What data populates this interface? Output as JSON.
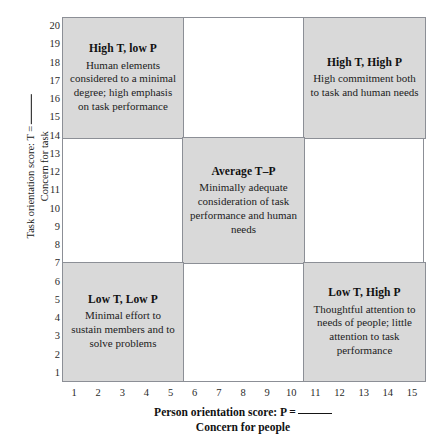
{
  "chart_data": {
    "type": "table",
    "xlabel_line1": "Person orientation score: P =",
    "xlabel_line2": "Concern for people",
    "ylabel_line1": "Task orientation score: T =",
    "ylabel_line2": "Concern for task",
    "xlim": [
      1,
      15
    ],
    "ylim": [
      1,
      20
    ],
    "x_ticks": [
      1,
      2,
      3,
      4,
      5,
      6,
      7,
      8,
      9,
      10,
      11,
      12,
      13,
      14,
      15
    ],
    "y_ticks": [
      1,
      2,
      3,
      4,
      5,
      6,
      7,
      8,
      9,
      10,
      11,
      12,
      13,
      14,
      15,
      16,
      17,
      18,
      19,
      20
    ],
    "grid": true,
    "legend": "none",
    "column_dividers_x": [
      5.5,
      10.5
    ],
    "row_dividers_y": [
      7.5,
      13.5
    ],
    "shaded_color": "#d9d9d9",
    "border_color": "#8c8f96",
    "cells": [
      {
        "id": "high-t-low-p",
        "row": "top",
        "column": "left",
        "shaded": true,
        "title": "High T, low P",
        "body": "Human elements considered to a minimal degree; high emphasis on task performance"
      },
      {
        "id": "top-middle-empty",
        "row": "top",
        "column": "middle",
        "shaded": false,
        "title": "",
        "body": ""
      },
      {
        "id": "high-t-high-p",
        "row": "top",
        "column": "right",
        "shaded": true,
        "title": "High T, High P",
        "body": "High commitment both to task and human needs"
      },
      {
        "id": "middle-left-empty",
        "row": "middle",
        "column": "left",
        "shaded": false,
        "title": "",
        "body": ""
      },
      {
        "id": "average-t-p",
        "row": "middle",
        "column": "middle",
        "shaded": true,
        "title": "Average T–P",
        "body": "Minimally adequate consideration of task performance and human needs"
      },
      {
        "id": "middle-right-empty",
        "row": "middle",
        "column": "right",
        "shaded": false,
        "title": "",
        "body": ""
      },
      {
        "id": "low-t-low-p",
        "row": "bottom",
        "column": "left",
        "shaded": true,
        "title": "Low T, Low P",
        "body": "Minimal effort to sustain members and to solve problems"
      },
      {
        "id": "bottom-middle-empty",
        "row": "bottom",
        "column": "middle",
        "shaded": false,
        "title": "",
        "body": ""
      },
      {
        "id": "low-t-high-p",
        "row": "bottom",
        "column": "right",
        "shaded": true,
        "title": "Low T, High P",
        "body": "Thoughtful attention to needs of people; little attention to task performance"
      }
    ]
  }
}
